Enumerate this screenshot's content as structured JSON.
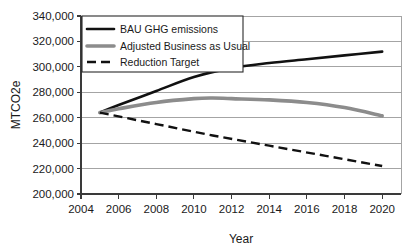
{
  "chart_data": {
    "type": "line",
    "title": "",
    "xlabel": "Year",
    "ylabel": "MTCO2e",
    "xlim": [
      2004,
      2021
    ],
    "ylim": [
      200000,
      340000
    ],
    "grid": true,
    "legend_position": "top-left",
    "xticks": [
      2004,
      2006,
      2008,
      2010,
      2012,
      2014,
      2016,
      2018,
      2020
    ],
    "xtick_labels": [
      "2004",
      "2006",
      "2008",
      "2010",
      "2012",
      "2014",
      "2016",
      "2018",
      "2020"
    ],
    "yticks": [
      200000,
      220000,
      240000,
      260000,
      280000,
      300000,
      320000,
      340000
    ],
    "ytick_labels": [
      "200,000",
      "220,000",
      "240,000",
      "260,000",
      "280,000",
      "300,000",
      "320,000",
      "340,000"
    ],
    "series": [
      {
        "name": "BAU GHG emissions",
        "style": "solid",
        "color": "#111111",
        "x": [
          2005,
          2006,
          2008,
          2010,
          2012,
          2014,
          2016,
          2018,
          2020
        ],
        "values": [
          264000,
          270000,
          281000,
          292000,
          299000,
          303000,
          306000,
          309000,
          312000
        ]
      },
      {
        "name": "Adjusted Business as Usual",
        "style": "solid-thick",
        "color": "#8c8c8c",
        "x": [
          2005,
          2006,
          2008,
          2010,
          2011,
          2012,
          2014,
          2016,
          2018,
          2020
        ],
        "values": [
          264000,
          267000,
          272000,
          275000,
          275500,
          275000,
          274000,
          272000,
          268000,
          261500
        ]
      },
      {
        "name": "Reduction Target",
        "style": "dashed",
        "color": "#111111",
        "x": [
          2005,
          2008,
          2011,
          2014,
          2017,
          2020
        ],
        "values": [
          264000,
          255000,
          246000,
          238000,
          230000,
          222000
        ]
      }
    ]
  },
  "legend": {
    "items": [
      {
        "label": "BAU GHG emissions",
        "swatch": "solid-black-line"
      },
      {
        "label": "Adjusted Business as Usual",
        "swatch": "thick-gray-line"
      },
      {
        "label": "Reduction Target",
        "swatch": "dashed-black-line"
      }
    ]
  }
}
